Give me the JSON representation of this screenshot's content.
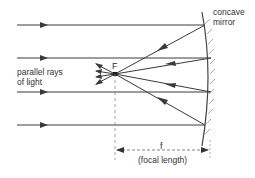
{
  "diagram": {
    "labels": {
      "mirror_line1": "concave",
      "mirror_line2": "mirror",
      "parallel_line1": "parallel rays",
      "parallel_line2": "of light",
      "focal_point": "F",
      "focal_symbol": "f",
      "focal_description": "(focal length)"
    },
    "colors": {
      "ray": "#3a3a3a",
      "mirror": "#555555",
      "dashed": "#888888",
      "text": "#333333"
    },
    "focal_point": {
      "x": 115,
      "y": 74
    },
    "incident_rays": [
      {
        "y": 25,
        "x_start": 17,
        "mirror_x": 205
      },
      {
        "y": 58,
        "x_start": 17,
        "mirror_x": 212
      },
      {
        "y": 92,
        "x_start": 17,
        "mirror_x": 212
      },
      {
        "y": 125,
        "x_start": 17,
        "mirror_x": 205
      }
    ],
    "mirror": {
      "top": [
        203,
        10
      ],
      "mid": [
        212,
        75
      ],
      "bottom": [
        203,
        145
      ]
    },
    "dimension": {
      "y": 150,
      "x_start": 115,
      "x_end": 210
    }
  }
}
